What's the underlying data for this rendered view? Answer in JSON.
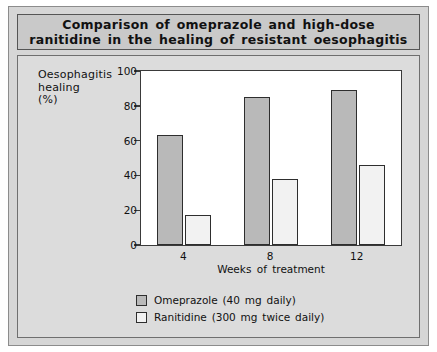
{
  "figure": {
    "title": "Comparison of omeprazole and high-dose ranitidine in the healing of resistant oesophagitis",
    "title_line1": "Comparison of omeprazole and high-dose",
    "title_line2": "ranitidine in the healing of resistant oesophagitis"
  },
  "axis": {
    "ylabel_line1": "Oesophagitis",
    "ylabel_line2": "healing",
    "ylabel_line3": "(%)",
    "xlabel": "Weeks of treatment"
  },
  "chart_data": {
    "type": "bar",
    "title": "Comparison of omeprazole and high-dose ranitidine in the healing of resistant oesophagitis",
    "xlabel": "Weeks of treatment",
    "ylabel": "Oesophagitis healing (%)",
    "categories": [
      "4",
      "8",
      "12"
    ],
    "series": [
      {
        "name": "Omeprazole (40 mg daily)",
        "values": [
          63,
          85,
          89
        ],
        "color": "#b9b9b9"
      },
      {
        "name": "Ranitidine (300 mg twice daily)",
        "values": [
          17.5,
          38,
          46
        ],
        "color": "#f2f2f2"
      }
    ],
    "ylim": [
      0,
      100
    ],
    "yticks": [
      0,
      20,
      40,
      60,
      80,
      100
    ],
    "ytick_labels": [
      "0",
      "20",
      "40",
      "60",
      "80",
      "100"
    ],
    "grid": false,
    "legend_position": "bottom"
  },
  "legend": {
    "items": [
      {
        "label": "Omeprazole (40 mg daily)"
      },
      {
        "label": "Ranitidine (300 mg twice daily)"
      }
    ]
  }
}
